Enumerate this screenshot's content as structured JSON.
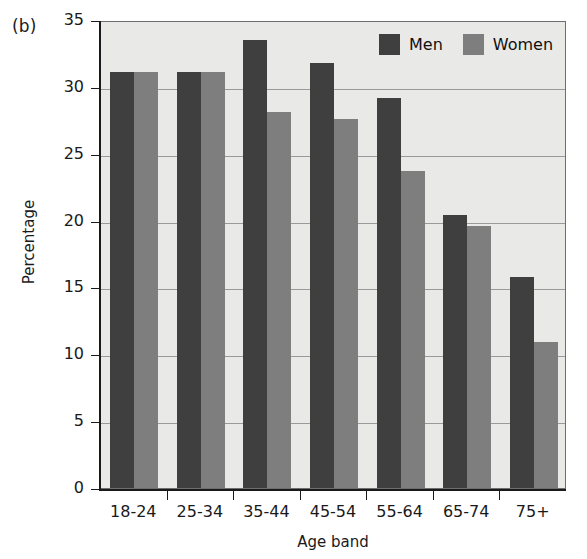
{
  "panel_label": "(b)",
  "chart_data": {
    "type": "bar",
    "title": "",
    "xlabel": "Age band",
    "ylabel": "Percentage",
    "categories": [
      "18-24",
      "25-34",
      "35-44",
      "45-54",
      "55-64",
      "65-74",
      "75+"
    ],
    "series": [
      {
        "name": "Men",
        "color": "#3f3f3f",
        "values": [
          31.1,
          31.1,
          33.5,
          31.8,
          29.2,
          20.4,
          15.8
        ]
      },
      {
        "name": "Women",
        "color": "#7e7e7e",
        "values": [
          31.1,
          31.1,
          28.1,
          27.6,
          23.7,
          19.6,
          10.9
        ]
      }
    ],
    "ylim": [
      0,
      35
    ],
    "yticks": [
      0,
      5,
      10,
      15,
      20,
      25,
      30,
      35
    ],
    "grid": true,
    "legend_position": "top-right",
    "plot_background": "#e9e9e7"
  }
}
